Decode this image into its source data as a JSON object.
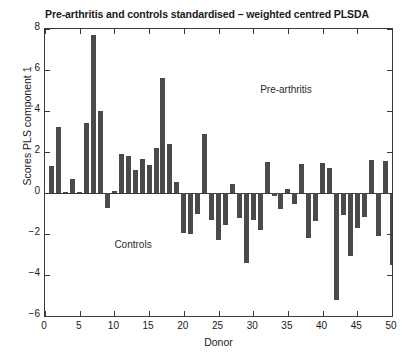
{
  "chart_data": {
    "type": "bar",
    "title": "Pre-arthritis and controls standardised – weighted centred PLSDA",
    "xlabel": "Donor",
    "ylabel": "Scores PLS component 1",
    "xlim": [
      0,
      50
    ],
    "ylim": [
      -6,
      8
    ],
    "xticks": [
      0,
      5,
      10,
      15,
      20,
      25,
      30,
      35,
      40,
      45,
      50
    ],
    "yticks": [
      -6,
      -4,
      -2,
      0,
      2,
      4,
      6,
      8
    ],
    "grid": false,
    "legend": "none",
    "bar_color": "#4a4a4a",
    "annotations": [
      {
        "text": "Pre-arthritis",
        "x": 31,
        "y": 5.0
      },
      {
        "text": "Controls",
        "x": 10,
        "y": -2.6
      }
    ],
    "categories": [
      1,
      2,
      3,
      4,
      5,
      6,
      7,
      8,
      9,
      10,
      11,
      12,
      13,
      14,
      15,
      16,
      17,
      18,
      19,
      20,
      21,
      22,
      23,
      24,
      25,
      26,
      27,
      28,
      29,
      30,
      31,
      32,
      33,
      34,
      35,
      36,
      37,
      38,
      39,
      40,
      41,
      42,
      43,
      44,
      45,
      46,
      47,
      48,
      49,
      50
    ],
    "values": [
      1.3,
      3.2,
      0.05,
      0.7,
      0.05,
      3.4,
      7.7,
      4.0,
      -0.75,
      0.12,
      1.9,
      1.8,
      1.1,
      1.65,
      1.35,
      2.2,
      5.6,
      2.4,
      0.55,
      -1.95,
      -2.0,
      -1.0,
      2.9,
      -1.3,
      -2.3,
      -1.55,
      0.45,
      -1.2,
      -3.4,
      -1.3,
      -1.8,
      1.5,
      -0.15,
      -0.8,
      0.2,
      -0.55,
      1.4,
      -2.2,
      -1.35,
      1.45,
      1.2,
      -5.2,
      -1.05,
      -3.05,
      -1.7,
      -1.15,
      1.6,
      -2.1,
      1.55,
      -3.5
    ]
  }
}
